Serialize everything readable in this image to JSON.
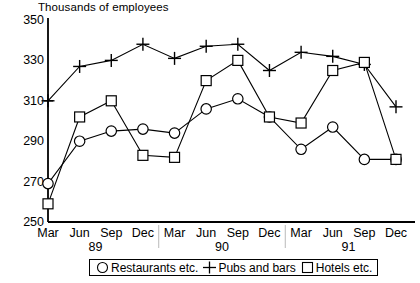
{
  "chart_data": {
    "type": "line",
    "title": "",
    "ylabel": "Thousands of employees",
    "xlabel": "",
    "ylim": [
      250,
      350
    ],
    "yticks": [
      250,
      270,
      290,
      310,
      330,
      350
    ],
    "grid": false,
    "legend_position": "bottom",
    "categories": [
      "Mar",
      "Jun",
      "Sep",
      "Dec",
      "Mar",
      "Jun",
      "Sep",
      "Dec",
      "Mar",
      "Jun",
      "Sep",
      "Dec"
    ],
    "year_groups": [
      {
        "label": "89",
        "start_index": 0,
        "end_index": 3
      },
      {
        "label": "90",
        "start_index": 4,
        "end_index": 7
      },
      {
        "label": "91",
        "start_index": 8,
        "end_index": 11
      }
    ],
    "series": [
      {
        "name": "Restaurants etc.",
        "marker": "circle",
        "values": [
          269,
          290,
          295,
          296,
          294,
          306,
          311,
          302,
          286,
          297,
          281,
          281
        ]
      },
      {
        "name": "Pubs and bars",
        "marker": "plus",
        "values": [
          310,
          327,
          330,
          338,
          331,
          337,
          338,
          325,
          334,
          332,
          328,
          307
        ]
      },
      {
        "name": "Hotels etc.",
        "marker": "square",
        "values": [
          259,
          302,
          310,
          283,
          282,
          320,
          330,
          302,
          299,
          325,
          329,
          281
        ]
      }
    ]
  },
  "legend": {
    "items": [
      {
        "label": "Restaurants etc.",
        "marker": "circle"
      },
      {
        "label": "Pubs and bars",
        "marker": "plus"
      },
      {
        "label": "Hotels etc.",
        "marker": "square"
      }
    ]
  },
  "colors": {
    "line": "#000000",
    "axis": "#000000",
    "background": "#ffffff"
  }
}
